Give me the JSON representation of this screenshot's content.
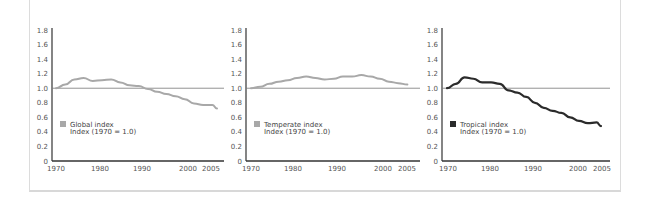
{
  "chart_data": [
    {
      "type": "line",
      "title": "Global index",
      "legend": [
        "Global index",
        "Index (1970 = 1.0)"
      ],
      "color": "#a8a8a8",
      "xlabel": "",
      "ylabel": "",
      "xticks": [
        "1970",
        "1980",
        "1990",
        "2000",
        "2005"
      ],
      "yticks": [
        "0",
        "0.2",
        "0.4",
        "0.6",
        "0.8",
        "1.0",
        "1.2",
        "1.4",
        "1.6",
        "1.8"
      ],
      "ylim": [
        0,
        1.8
      ],
      "xlim": [
        1970,
        2005
      ],
      "reference_line": 1.0,
      "x": [
        1970,
        1972,
        1974,
        1976,
        1978,
        1980,
        1982,
        1984,
        1986,
        1988,
        1990,
        1992,
        1994,
        1996,
        1998,
        2000,
        2002,
        2004,
        2005
      ],
      "values": [
        1.0,
        1.05,
        1.12,
        1.14,
        1.1,
        1.11,
        1.12,
        1.08,
        1.04,
        1.03,
        0.99,
        0.95,
        0.92,
        0.89,
        0.85,
        0.79,
        0.77,
        0.77,
        0.72
      ]
    },
    {
      "type": "line",
      "title": "Temperate index",
      "legend": [
        "Temperate index",
        "Index (1970 = 1.0)"
      ],
      "color": "#a8a8a8",
      "xlabel": "",
      "ylabel": "",
      "xticks": [
        "1970",
        "1980",
        "1990",
        "2000",
        "2005"
      ],
      "yticks": [
        "0",
        "0.2",
        "0.4",
        "0.6",
        "0.8",
        "1.0",
        "1.2",
        "1.4",
        "1.6",
        "1.8"
      ],
      "ylim": [
        0,
        1.8
      ],
      "xlim": [
        1970,
        2005
      ],
      "reference_line": 1.0,
      "x": [
        1970,
        1972,
        1974,
        1976,
        1978,
        1980,
        1982,
        1984,
        1986,
        1988,
        1990,
        1992,
        1994,
        1996,
        1998,
        2000,
        2002,
        2004
      ],
      "values": [
        1.0,
        1.02,
        1.06,
        1.09,
        1.11,
        1.14,
        1.16,
        1.14,
        1.12,
        1.13,
        1.16,
        1.16,
        1.18,
        1.16,
        1.13,
        1.09,
        1.07,
        1.05
      ]
    },
    {
      "type": "line",
      "title": "Tropical index",
      "legend": [
        "Tropical index",
        "Index (1970 = 1.0)"
      ],
      "color": "#2b2b2b",
      "xlabel": "",
      "ylabel": "",
      "xticks": [
        "1970",
        "1980",
        "1990",
        "2000",
        "2005"
      ],
      "yticks": [
        "0",
        "0.2",
        "0.4",
        "0.6",
        "0.8",
        "1.0",
        "1.2",
        "1.4",
        "1.6",
        "1.8"
      ],
      "ylim": [
        0,
        1.8
      ],
      "xlim": [
        1970,
        2005
      ],
      "reference_line": 1.0,
      "x": [
        1970,
        1972,
        1974,
        1976,
        1978,
        1980,
        1982,
        1984,
        1986,
        1988,
        1990,
        1992,
        1994,
        1996,
        1998,
        2000,
        2002,
        2004,
        2005
      ],
      "values": [
        1.0,
        1.06,
        1.15,
        1.13,
        1.08,
        1.08,
        1.06,
        0.97,
        0.94,
        0.88,
        0.8,
        0.73,
        0.69,
        0.66,
        0.6,
        0.55,
        0.52,
        0.53,
        0.48
      ]
    }
  ]
}
